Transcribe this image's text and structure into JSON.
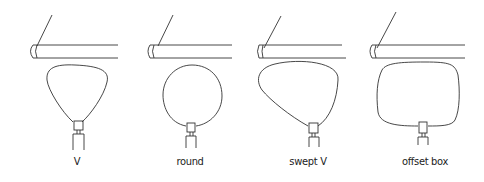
{
  "diagram": {
    "panels": [
      {
        "id": "v",
        "label": "V",
        "x": 77
      },
      {
        "id": "round",
        "label": "round",
        "x": 190
      },
      {
        "id": "swept-v",
        "label": "swept V",
        "x": 308
      },
      {
        "id": "offset-box",
        "label": "offset box",
        "x": 425
      }
    ],
    "colors": {
      "stroke": "#333333",
      "background": "#ffffff"
    }
  }
}
